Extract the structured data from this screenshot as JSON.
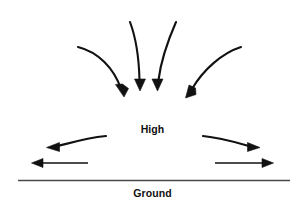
{
  "figure": {
    "kind": "meteorology-schematic",
    "width": 305,
    "height": 208,
    "background_color": "#ffffff",
    "stroke_color": "#111111",
    "ground_line_color": "#4a4a4a"
  },
  "labels": {
    "high": "High",
    "ground": "Ground"
  },
  "arrows": {
    "converging": [
      {
        "name": "inflow-arrow-far-left",
        "description": "curved arrow descending from upper left toward center",
        "start": [
          78,
          47
        ],
        "end": [
          124,
          97
        ],
        "direction": "down-right"
      },
      {
        "name": "inflow-arrow-center-left",
        "description": "near vertical curved arrow descending to center",
        "start": [
          131,
          22
        ],
        "end": [
          140,
          90
        ],
        "direction": "down"
      },
      {
        "name": "inflow-arrow-center-right",
        "description": "near vertical curved arrow descending to center",
        "start": [
          176,
          22
        ],
        "end": [
          158,
          90
        ],
        "direction": "down"
      },
      {
        "name": "inflow-arrow-far-right",
        "description": "curved arrow descending from upper right toward center",
        "start": [
          241,
          47
        ],
        "end": [
          186,
          97
        ],
        "direction": "down-left"
      }
    ],
    "diverging": [
      {
        "name": "outflow-arrow-upper-left",
        "description": "curved arrow sweeping out to the left",
        "start": [
          106,
          136
        ],
        "end": [
          48,
          147
        ],
        "direction": "left"
      },
      {
        "name": "outflow-arrow-upper-right",
        "description": "curved arrow sweeping out to the right",
        "start": [
          203,
          136
        ],
        "end": [
          258,
          147
        ],
        "direction": "right"
      },
      {
        "name": "outflow-arrow-lower-left",
        "description": "straight horizontal arrow pointing left",
        "start": [
          88,
          163
        ],
        "end": [
          33,
          163
        ],
        "direction": "left"
      },
      {
        "name": "outflow-arrow-lower-right",
        "description": "straight horizontal arrow pointing right",
        "start": [
          215,
          163
        ],
        "end": [
          273,
          163
        ],
        "direction": "right"
      }
    ]
  },
  "ground_line": {
    "name": "ground-line",
    "x1": 18,
    "x2": 290,
    "y": 180
  }
}
